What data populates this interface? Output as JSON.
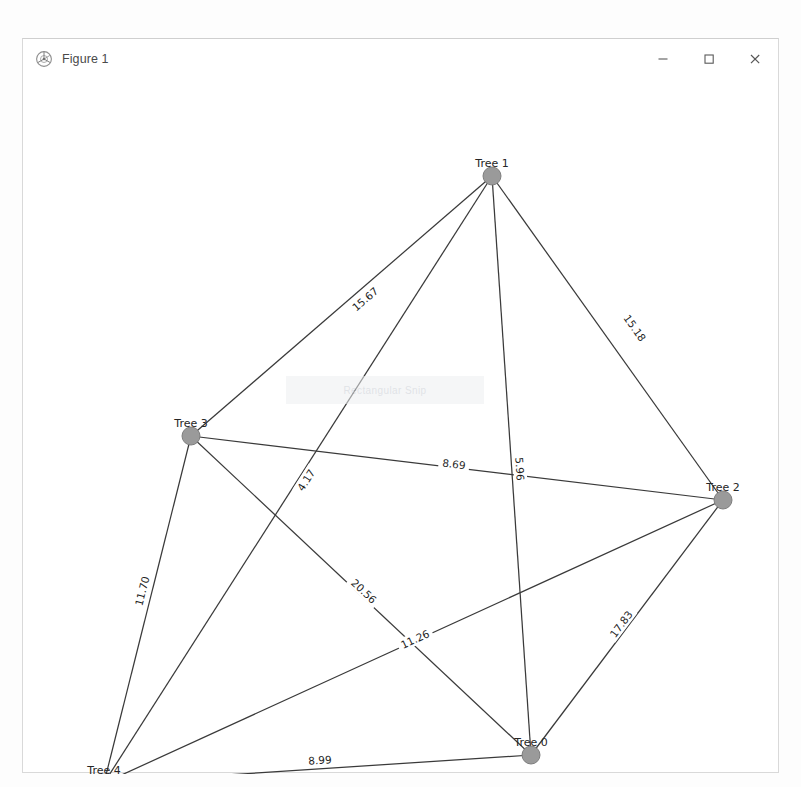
{
  "window": {
    "title": "Figure 1",
    "icon": "matplotlib-icon",
    "minimize_label": "–",
    "maximize_label": "□",
    "close_label": "×"
  },
  "watermark": {
    "text": "Rectangular Snip"
  },
  "chart_data": {
    "type": "graph",
    "title": "",
    "xlabel": "",
    "ylabel": "",
    "grid": false,
    "legend": "none",
    "layout": "spring",
    "node_color": "#9a9a9a",
    "edge_color": "#3a3a3a",
    "xlim": [
      0,
      757
    ],
    "ylim": [
      0,
      695
    ],
    "nodes": [
      {
        "id": "n0",
        "label": "Tree 0",
        "x": 508,
        "y": 676,
        "degree": 4
      },
      {
        "id": "n1",
        "label": "Tree 1",
        "x": 469,
        "y": 97,
        "degree": 4
      },
      {
        "id": "n2",
        "label": "Tree 2",
        "x": 700,
        "y": 421,
        "degree": 4
      },
      {
        "id": "n3",
        "label": "Tree 3",
        "x": 168,
        "y": 357,
        "degree": 4
      },
      {
        "id": "n4",
        "label": "Tree 4",
        "x": 81,
        "y": 704,
        "degree": 4
      }
    ],
    "edges": [
      {
        "source": "n1",
        "target": "n3",
        "weight": 15.67,
        "label": "15.67",
        "label_x": 342,
        "label_y": 220
      },
      {
        "source": "n1",
        "target": "n2",
        "weight": 15.18,
        "label": "15.18",
        "label_x": 612,
        "label_y": 249
      },
      {
        "source": "n1",
        "target": "n0",
        "weight": 5.96,
        "label": "5.96",
        "label_x": 497,
        "label_y": 390
      },
      {
        "source": "n1",
        "target": "n4",
        "weight": 4.17,
        "label": "4.17",
        "label_x": 283,
        "label_y": 401
      },
      {
        "source": "n3",
        "target": "n2",
        "weight": 8.69,
        "label": "8.69",
        "label_x": 431,
        "label_y": 385
      },
      {
        "source": "n3",
        "target": "n4",
        "weight": 11.7,
        "label": "11.70",
        "label_x": 119,
        "label_y": 512
      },
      {
        "source": "n3",
        "target": "n0",
        "weight": 20.56,
        "label": "20.56",
        "label_x": 341,
        "label_y": 512
      },
      {
        "source": "n4",
        "target": "n2",
        "weight": 11.26,
        "label": "11.26",
        "label_x": 392,
        "label_y": 560
      },
      {
        "source": "n2",
        "target": "n0",
        "weight": 17.83,
        "label": "17.83",
        "label_x": 598,
        "label_y": 545
      },
      {
        "source": "n4",
        "target": "n0",
        "weight": 8.99,
        "label": "8.99",
        "label_x": 297,
        "label_y": 681
      }
    ]
  }
}
